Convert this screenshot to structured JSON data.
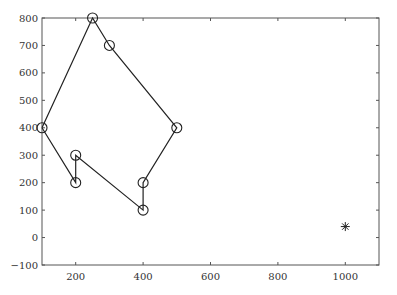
{
  "chart_data": {
    "type": "line",
    "title": "",
    "xlabel": "",
    "ylabel": "",
    "xlim": [
      100,
      1100
    ],
    "ylim": [
      -100,
      800
    ],
    "xticks": [
      200,
      400,
      600,
      800,
      1000
    ],
    "yticks": [
      -100,
      0,
      100,
      200,
      300,
      400,
      500,
      600,
      700,
      800
    ],
    "xtick_labels": [
      "200",
      "400",
      "600",
      "800",
      "1000"
    ],
    "ytick_labels": [
      "−100",
      "0",
      "100",
      "200",
      "300",
      "400",
      "500",
      "600",
      "700",
      "800"
    ],
    "grid": false,
    "legend": null,
    "series": [
      {
        "name": "closed path",
        "marker": "circle",
        "line": "solid",
        "color": "#222222",
        "closed": true,
        "x": [
          100,
          250,
          300,
          500,
          400,
          400,
          200,
          200,
          100
        ],
        "y": [
          400,
          800,
          700,
          400,
          200,
          100,
          300,
          200,
          400
        ]
      },
      {
        "name": "point",
        "marker": "asterisk",
        "line": "none",
        "color": "#222222",
        "x": [
          1000
        ],
        "y": [
          40
        ]
      }
    ]
  }
}
